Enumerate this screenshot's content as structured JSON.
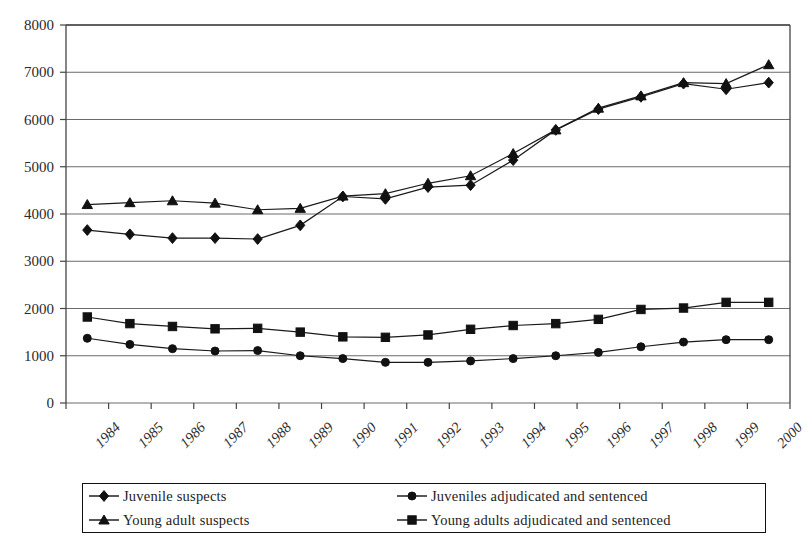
{
  "chart_data": {
    "type": "line",
    "title": "",
    "subtitle": "",
    "xlabel": "",
    "ylabel": "",
    "x": [
      1984,
      1985,
      1986,
      1987,
      1988,
      1989,
      1990,
      1991,
      1992,
      1993,
      1994,
      1995,
      1996,
      1997,
      1998,
      1999,
      2000
    ],
    "categories": [
      "1984",
      "1985",
      "1986",
      "1987",
      "1988",
      "1989",
      "1990",
      "1991",
      "1992",
      "1993",
      "1994",
      "1995",
      "1996",
      "1997",
      "1998",
      "1999",
      "2000"
    ],
    "xlim": [
      1983.5,
      2000.5
    ],
    "ylim": [
      0,
      8000
    ],
    "yticks": [
      0,
      1000,
      2000,
      3000,
      4000,
      5000,
      6000,
      7000,
      8000
    ],
    "ytick_labels": [
      "0",
      "1000",
      "2000",
      "3000",
      "4000",
      "5000",
      "6000",
      "7000",
      "8000"
    ],
    "grid": true,
    "grid_axis": "y",
    "legend_position": "bottom",
    "legend_columns": 2,
    "series": [
      {
        "name": "Juvenile suspects",
        "marker": "diamond",
        "color": "#000000",
        "values": [
          3660,
          3570,
          3490,
          3490,
          3470,
          3760,
          4370,
          4320,
          4570,
          4610,
          5140,
          5780,
          6220,
          6480,
          6760,
          6640,
          6780
        ]
      },
      {
        "name": "Young adult suspects",
        "marker": "triangle",
        "color": "#000000",
        "values": [
          4200,
          4240,
          4280,
          4230,
          4090,
          4120,
          4380,
          4430,
          4650,
          4810,
          5280,
          5780,
          6240,
          6500,
          6780,
          6760,
          7160
        ]
      },
      {
        "name": "Juveniles adjudicated and sentenced",
        "marker": "circle",
        "color": "#000000",
        "values": [
          1370,
          1240,
          1150,
          1100,
          1110,
          1000,
          940,
          860,
          860,
          890,
          940,
          1000,
          1070,
          1190,
          1290,
          1340,
          1340
        ]
      },
      {
        "name": "Young adults adjudicated and sentenced",
        "marker": "square",
        "color": "#000000",
        "values": [
          1820,
          1680,
          1620,
          1570,
          1580,
          1500,
          1400,
          1390,
          1440,
          1560,
          1640,
          1680,
          1770,
          1980,
          2010,
          2130,
          2130
        ]
      }
    ]
  },
  "legend": {
    "entries": [
      {
        "label": "Juvenile suspects",
        "marker": "diamond"
      },
      {
        "label": "Juveniles adjudicated and sentenced",
        "marker": "circle"
      },
      {
        "label": "Young adult suspects",
        "marker": "triangle"
      },
      {
        "label": "Young adults adjudicated and sentenced",
        "marker": "square"
      }
    ]
  },
  "axis_colors": {
    "axis_line": "#444444",
    "grid_line": "#6b6b6b",
    "series_line": "#1a1a1a"
  }
}
